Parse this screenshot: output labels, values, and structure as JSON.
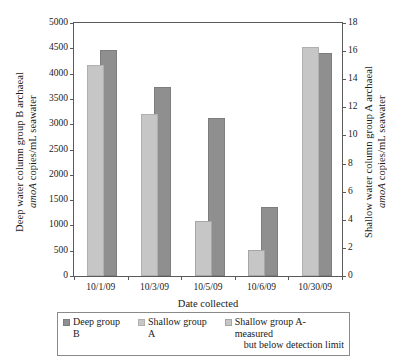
{
  "chart_data": {
    "type": "bar",
    "title": "",
    "xlabel": "Date collected",
    "categories": [
      "10/1/09",
      "10/3/09",
      "10/5/09",
      "10/6/09",
      "10/30/09"
    ],
    "grid": false,
    "legend_position": "bottom",
    "axes": {
      "left": {
        "label_line1": "Deep water column group B archaeal",
        "label_line2_italic": "amoA",
        "label_line2_rest": " copies/mL seawater",
        "min": 0,
        "max": 5000,
        "step": 500,
        "ticks": [
          "0",
          "500",
          "1000",
          "1500",
          "2000",
          "2500",
          "3000",
          "3500",
          "4000",
          "4500",
          "5000"
        ]
      },
      "right": {
        "label_line1": "Shallow water column group A archaeal",
        "label_line2_italic": "amoA",
        "label_line2_rest": " copies/mL seawater",
        "min": 0,
        "max": 18,
        "step": 2,
        "ticks": [
          "0",
          "2",
          "4",
          "6",
          "8",
          "10",
          "12",
          "14",
          "16",
          "18"
        ]
      }
    },
    "series": [
      {
        "name": "Deep group B",
        "key": "deep",
        "axis": "left",
        "color": "#8f8f8f",
        "values": [
          4460,
          3730,
          3120,
          1370,
          4400
        ]
      },
      {
        "name": "Shallow group A",
        "key": "shallow",
        "axis": "right",
        "color": "#c6c6c6",
        "values": [
          15.0,
          11.5,
          null,
          null,
          16.3
        ]
      },
      {
        "name": "Shallow group A-measured but below detection limit",
        "key": "shallowbd",
        "axis": "right",
        "color": "#c6c6c6",
        "values": [
          null,
          null,
          3.9,
          1.85,
          null
        ]
      }
    ]
  },
  "legend": {
    "items": [
      {
        "label": "Deep group B",
        "label_line2": ""
      },
      {
        "label": "Shallow group A",
        "label_line2": ""
      },
      {
        "label": "Shallow group A-measured",
        "label_line2": "but below detection limit"
      }
    ]
  }
}
